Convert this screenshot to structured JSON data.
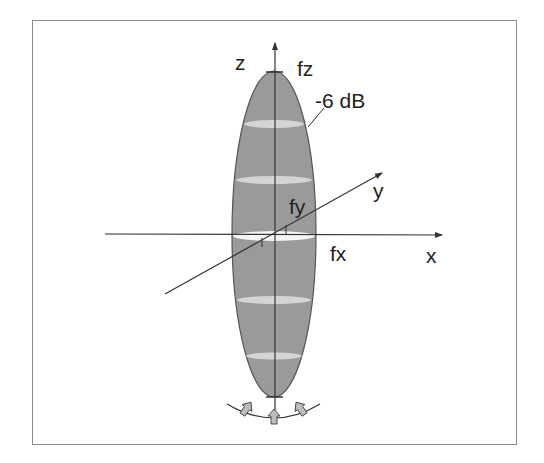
{
  "diagram": {
    "labels": {
      "z_axis": "z",
      "fz": "fz",
      "minus_6db": "-6 dB",
      "y_axis": "y",
      "fy": "fy",
      "fx": "fx",
      "x_axis": "x"
    },
    "colors": {
      "frame": "#8c8c8c",
      "beam_fill": "#9a9a9a",
      "beam_band": "#d8d8d8",
      "axis": "#333333",
      "arrow_fill": "#bdbdbd"
    }
  }
}
